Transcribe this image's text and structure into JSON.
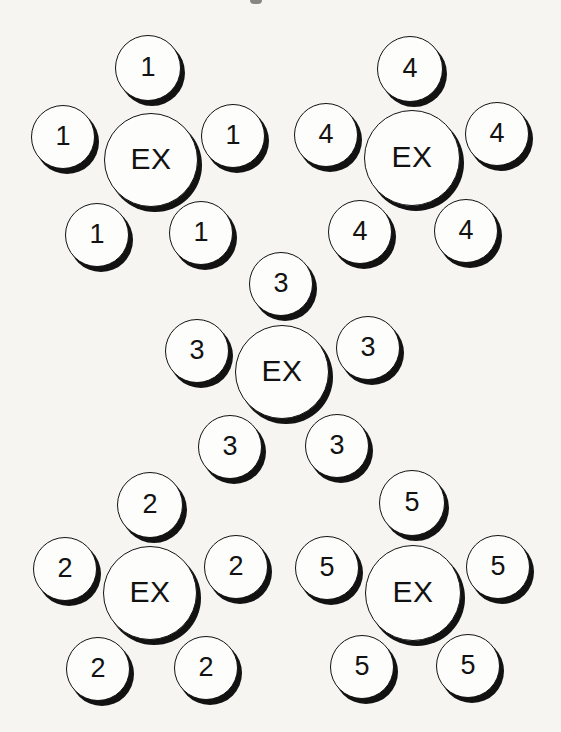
{
  "figure": {
    "center_label": "EX",
    "background_color": "#f6f5f2",
    "circle_fill": "#fdfdfb",
    "ink_color": "#121212",
    "shadow_offset_x": 4,
    "shadow_offset_y": 5
  },
  "clusters": [
    {
      "group_label": "1",
      "placement": "top-left",
      "center": {
        "label": "EX",
        "x": 151,
        "y": 160,
        "r": 47
      },
      "satellites": [
        {
          "label": "1",
          "pos": "top",
          "x": 148,
          "y": 68,
          "r": 33
        },
        {
          "label": "1",
          "pos": "left",
          "x": 63,
          "y": 137,
          "r": 32
        },
        {
          "label": "1",
          "pos": "right",
          "x": 233,
          "y": 136,
          "r": 32
        },
        {
          "label": "1",
          "pos": "bottom-left",
          "x": 97,
          "y": 235,
          "r": 32
        },
        {
          "label": "1",
          "pos": "bottom-right",
          "x": 201,
          "y": 233,
          "r": 32
        }
      ]
    },
    {
      "group_label": "4",
      "placement": "top-right",
      "center": {
        "label": "EX",
        "x": 412,
        "y": 158,
        "r": 48
      },
      "satellites": [
        {
          "label": "4",
          "pos": "top",
          "x": 410,
          "y": 69,
          "r": 33
        },
        {
          "label": "4",
          "pos": "left",
          "x": 326,
          "y": 135,
          "r": 32
        },
        {
          "label": "4",
          "pos": "right",
          "x": 497,
          "y": 134,
          "r": 32
        },
        {
          "label": "4",
          "pos": "bottom-left",
          "x": 360,
          "y": 232,
          "r": 32
        },
        {
          "label": "4",
          "pos": "bottom-right",
          "x": 466,
          "y": 231,
          "r": 32
        }
      ]
    },
    {
      "group_label": "3",
      "placement": "middle",
      "center": {
        "label": "EX",
        "x": 282,
        "y": 372,
        "r": 47
      },
      "satellites": [
        {
          "label": "3",
          "pos": "top",
          "x": 281,
          "y": 284,
          "r": 32
        },
        {
          "label": "3",
          "pos": "left",
          "x": 197,
          "y": 351,
          "r": 32
        },
        {
          "label": "3",
          "pos": "right",
          "x": 368,
          "y": 348,
          "r": 32
        },
        {
          "label": "3",
          "pos": "bottom-left",
          "x": 230,
          "y": 447,
          "r": 32
        },
        {
          "label": "3",
          "pos": "bottom-right",
          "x": 337,
          "y": 446,
          "r": 32
        }
      ]
    },
    {
      "group_label": "2",
      "placement": "bottom-left",
      "center": {
        "label": "EX",
        "x": 150,
        "y": 593,
        "r": 47
      },
      "satellites": [
        {
          "label": "2",
          "pos": "top",
          "x": 150,
          "y": 505,
          "r": 33
        },
        {
          "label": "2",
          "pos": "left",
          "x": 65,
          "y": 569,
          "r": 32
        },
        {
          "label": "2",
          "pos": "right",
          "x": 236,
          "y": 567,
          "r": 32
        },
        {
          "label": "2",
          "pos": "bottom-left",
          "x": 98,
          "y": 669,
          "r": 32
        },
        {
          "label": "2",
          "pos": "bottom-right",
          "x": 206,
          "y": 668,
          "r": 32
        }
      ]
    },
    {
      "group_label": "5",
      "placement": "bottom-right",
      "center": {
        "label": "EX",
        "x": 413,
        "y": 593,
        "r": 48
      },
      "satellites": [
        {
          "label": "5",
          "pos": "top",
          "x": 412,
          "y": 503,
          "r": 33
        },
        {
          "label": "5",
          "pos": "left",
          "x": 327,
          "y": 568,
          "r": 32
        },
        {
          "label": "5",
          "pos": "right",
          "x": 498,
          "y": 567,
          "r": 32
        },
        {
          "label": "5",
          "pos": "bottom-left",
          "x": 362,
          "y": 667,
          "r": 32
        },
        {
          "label": "5",
          "pos": "bottom-right",
          "x": 468,
          "y": 666,
          "r": 32
        }
      ]
    }
  ],
  "artifact": {
    "x": 250,
    "y": 0,
    "width": 12,
    "height": 4
  }
}
